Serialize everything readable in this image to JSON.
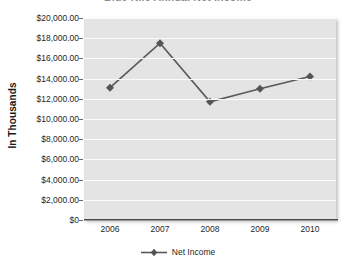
{
  "chart_data": {
    "type": "line",
    "title": "Blue Nile Annual Net Income",
    "xlabel": "",
    "ylabel": "In Thousands",
    "categories": [
      "2006",
      "2007",
      "2008",
      "2009",
      "2010"
    ],
    "series": [
      {
        "name": "Net Income",
        "values": [
          13100,
          17500,
          11700,
          13000,
          14200
        ]
      }
    ],
    "ylim": [
      0,
      20000
    ],
    "ytick_values": [
      0,
      2000,
      4000,
      6000,
      8000,
      10000,
      12000,
      14000,
      16000,
      18000,
      20000
    ],
    "ytick_labels": [
      "$0",
      "$2,000.00",
      "$4,000.00",
      "$6,000.00",
      "$8,000.00",
      "$10,000.00",
      "$12,000.00",
      "$14,000.00",
      "$16,000.00",
      "$18,000.00",
      "$20,000.00"
    ],
    "grid": true,
    "legend_position": "bottom",
    "colors": {
      "series_line": "#595959",
      "marker": "#555555",
      "plot_background": "#e4e4e4",
      "gridline": "#fbfbfb",
      "axis_line": "#4a4a4a",
      "text": "#1f1f1f"
    }
  },
  "legend": {
    "entries": [
      {
        "label": "Net Income",
        "marker": "diamond-marker"
      }
    ]
  }
}
